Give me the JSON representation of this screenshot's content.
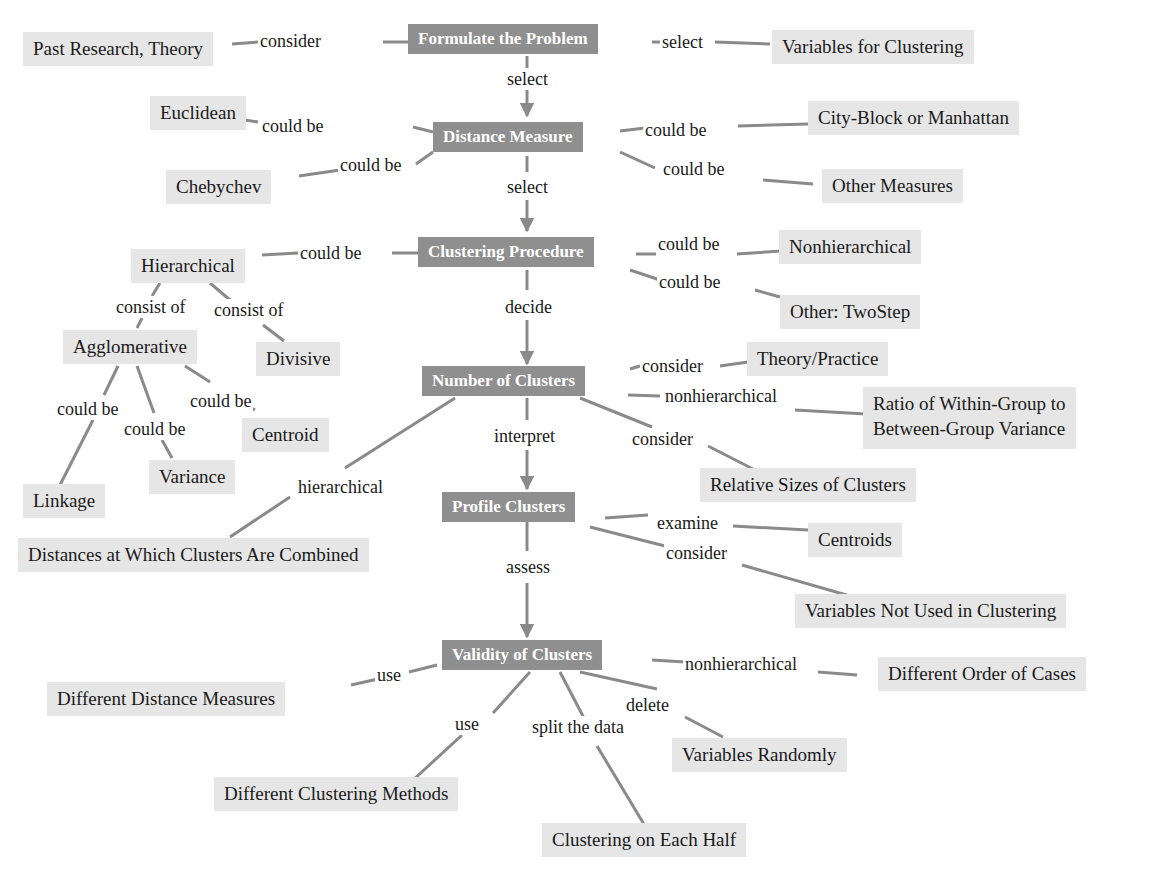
{
  "colors": {
    "main_box": "#8f8f8f",
    "leaf_box": "#e6e6e6",
    "connector": "#8a8a8a"
  },
  "main_steps": [
    "Formulate the Problem",
    "Distance Measure",
    "Clustering Procedure",
    "Number of Clusters",
    "Profile Clusters",
    "Validity of Clusters"
  ],
  "step_links": [
    "select",
    "select",
    "decide",
    "interpret",
    "assess"
  ],
  "nodes": {
    "past_research": "Past Research, Theory",
    "variables_for_clustering": "Variables for Clustering",
    "euclidean": "Euclidean",
    "city_block": "City-Block or Manhattan",
    "chebychev": "Chebychev",
    "other_measures": "Other Measures",
    "hierarchical": "Hierarchical",
    "nonhierarchical": "Nonhierarchical",
    "other_twostep": "Other: TwoStep",
    "agglomerative": "Agglomerative",
    "divisive": "Divisive",
    "centroid": "Centroid",
    "variance": "Variance",
    "linkage": "Linkage",
    "theory_practice": "Theory/Practice",
    "ratio_line1": "Ratio of Within-Group to",
    "ratio_line2": "Between-Group Variance",
    "relative_sizes": "Relative Sizes of Clusters",
    "distances_combined": "Distances at Which Clusters Are Combined",
    "centroids": "Centroids",
    "variables_not_used": "Variables Not Used in Clustering",
    "different_distance": "Different Distance Measures",
    "different_order": "Different Order of Cases",
    "variables_randomly": "Variables Randomly",
    "different_methods": "Different Clustering Methods",
    "each_half": "Clustering on Each Half"
  },
  "edge_labels": {
    "consider_past": "consider",
    "select_vars": "select",
    "could_be_euclid": "could be",
    "could_be_city": "could be",
    "could_be_cheby": "could be",
    "could_be_other": "could be",
    "could_be_hier": "could be",
    "could_be_nonhier": "could be",
    "could_be_twostep": "could be",
    "consist_of_agg": "consist of",
    "consist_of_div": "consist of",
    "could_be_linkage": "could be",
    "could_be_variance": "could be",
    "could_be_centroid": "could be",
    "consider_theory": "consider",
    "nonhierarchical_ratio": "nonhierarchical",
    "consider_sizes": "consider",
    "hierarchical_dist": "hierarchical",
    "examine_centroids": "examine",
    "consider_vars": "consider",
    "use_distance": "use",
    "nonhierarchical_order": "nonhierarchical",
    "delete_vars": "delete",
    "use_methods": "use",
    "split_data": "split the data"
  }
}
